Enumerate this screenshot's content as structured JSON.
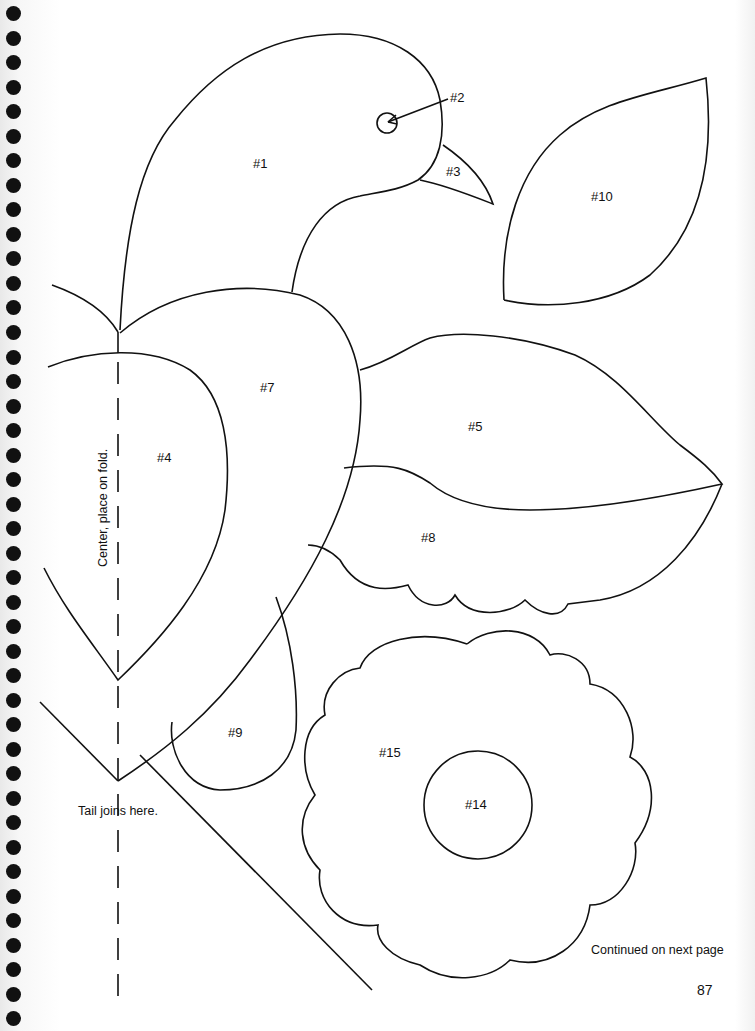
{
  "page": {
    "page_number": "87",
    "continued_note": "Continued on next page",
    "fold_note": "Center, place on fold.",
    "tail_note": "Tail joins here."
  },
  "pieces": {
    "p1": "#1",
    "p2": "#2",
    "p3": "#3",
    "p4": "#4",
    "p5": "#5",
    "p7": "#7",
    "p8": "#8",
    "p9": "#9",
    "p10": "#10",
    "p14": "#14",
    "p15": "#15"
  },
  "binding": {
    "hole_count": 30,
    "hole_color": "#111111"
  },
  "colors": {
    "ink": "#111111",
    "paper": "#ffffff"
  }
}
